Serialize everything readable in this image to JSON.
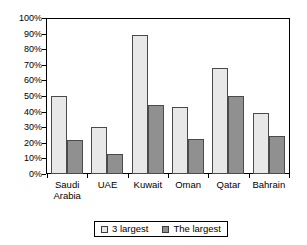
{
  "chart_data": {
    "type": "bar",
    "title": "",
    "subtitle": "",
    "xlabel": "",
    "ylabel": "",
    "ylim": [
      0,
      100
    ],
    "ytick_labels": [
      "100%",
      "90%",
      "80%",
      "70%",
      "60%",
      "50%",
      "40%",
      "30%",
      "20%",
      "10%",
      "0%"
    ],
    "ytick_values": [
      100,
      90,
      80,
      70,
      60,
      50,
      40,
      30,
      20,
      10,
      0
    ],
    "grid": false,
    "legend_position": "bottom",
    "categories": [
      "Saudi\nArabia",
      "UAE",
      "Kuwait",
      "Oman",
      "Qatar",
      "Bahrain"
    ],
    "series": [
      {
        "name": "3 largest",
        "color": "#e8e8e8",
        "values": [
          50,
          30,
          89,
          43,
          68,
          39
        ]
      },
      {
        "name": "The largest",
        "color": "#909090",
        "values": [
          21.5,
          13,
          44,
          22.5,
          50,
          24.5
        ]
      }
    ]
  },
  "colors": {
    "series_a": "#e8e8e8",
    "series_b": "#909090",
    "bar_outline": "#4a4a4a",
    "axis": "#000000",
    "background": "#ffffff"
  }
}
